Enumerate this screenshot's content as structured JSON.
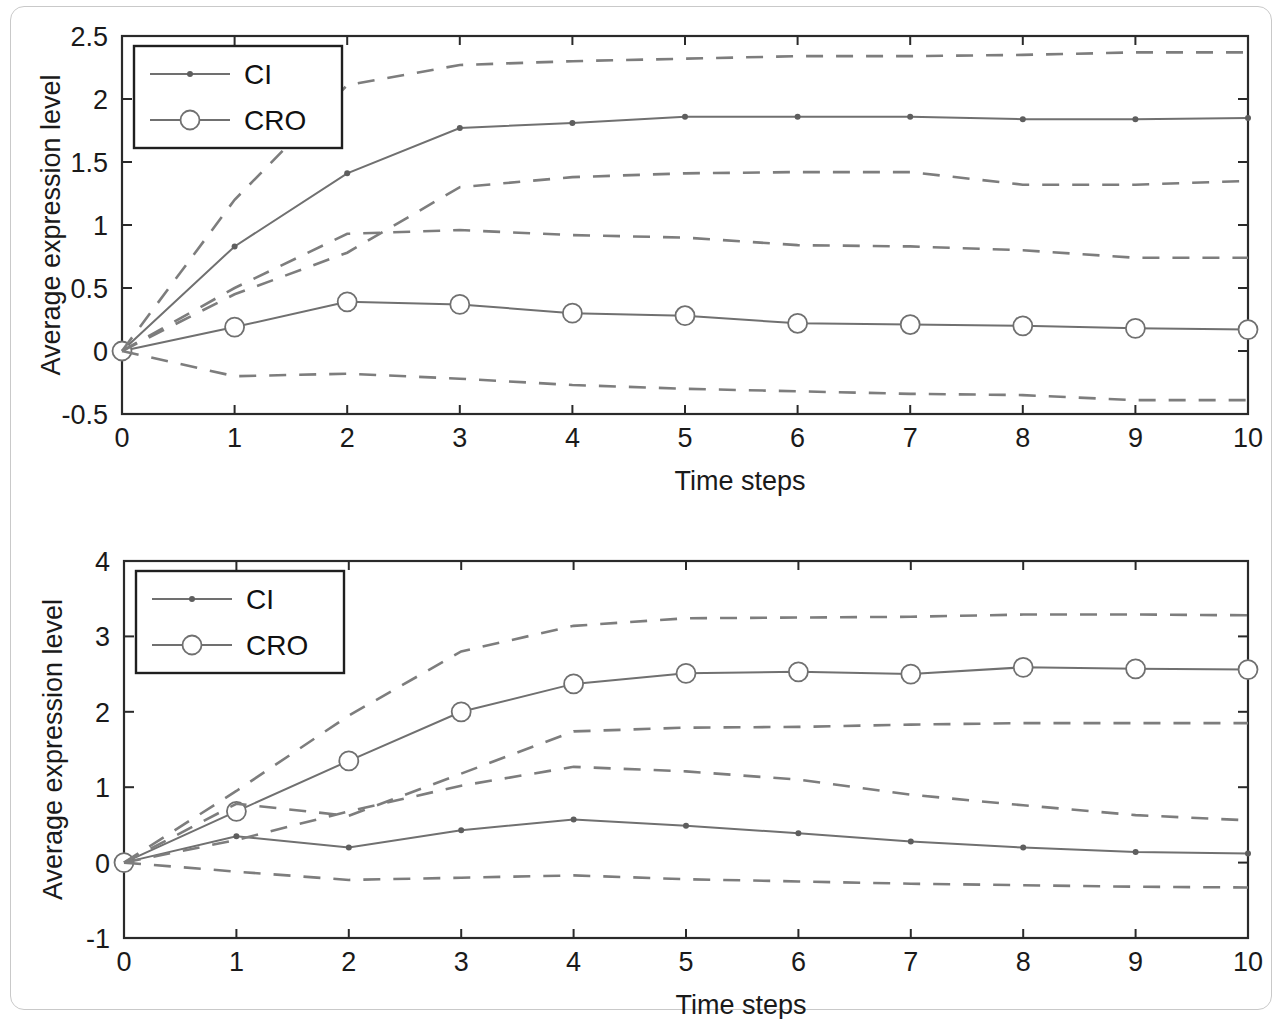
{
  "figure": {
    "panels": [
      {
        "id": "top-panel",
        "ylabel": "Average expression level",
        "xlabel": "Time steps",
        "legend": [
          {
            "label": "CI",
            "marker": "dot"
          },
          {
            "label": "CRO",
            "marker": "circle"
          }
        ],
        "y_ticks": [
          "-0.5",
          "0",
          "0.5",
          "1",
          "1.5",
          "2",
          "2.5"
        ],
        "x_ticks": [
          "0",
          "1",
          "2",
          "3",
          "4",
          "5",
          "6",
          "7",
          "8",
          "9",
          "10"
        ]
      },
      {
        "id": "bottom-panel",
        "ylabel": "Average expression level",
        "xlabel": "Time steps",
        "legend": [
          {
            "label": "CI",
            "marker": "dot"
          },
          {
            "label": "CRO",
            "marker": "circle"
          }
        ],
        "y_ticks": [
          "-1",
          "0",
          "1",
          "2",
          "3",
          "4"
        ],
        "x_ticks": [
          "0",
          "1",
          "2",
          "3",
          "4",
          "5",
          "6",
          "7",
          "8",
          "9",
          "10"
        ]
      }
    ],
    "colors": {
      "line": "#707070",
      "dashed": "#7d7d7d",
      "axis": "#2a2a2a",
      "text": "#141414",
      "frame": "#c9c9c9"
    }
  },
  "chart_data": [
    {
      "type": "line",
      "title": "",
      "xlabel": "Time steps",
      "ylabel": "Average expression level",
      "xlim": [
        0,
        10
      ],
      "ylim": [
        -0.5,
        2.5
      ],
      "yticks": [
        -0.5,
        0,
        0.5,
        1,
        1.5,
        2,
        2.5
      ],
      "xticks": [
        0,
        1,
        2,
        3,
        4,
        5,
        6,
        7,
        8,
        9,
        10
      ],
      "grid": false,
      "legend": [
        "CI",
        "CRO"
      ],
      "legend_position": "upper left",
      "x": [
        0,
        1,
        2,
        3,
        4,
        5,
        6,
        7,
        8,
        9,
        10
      ],
      "series": [
        {
          "name": "CI",
          "style": "solid",
          "marker": "dot",
          "values": [
            0.0,
            0.83,
            1.41,
            1.77,
            1.81,
            1.86,
            1.86,
            1.86,
            1.84,
            1.84,
            1.85
          ]
        },
        {
          "name": "CRO",
          "style": "solid",
          "marker": "circle",
          "values": [
            0.0,
            0.19,
            0.39,
            0.37,
            0.3,
            0.28,
            0.22,
            0.21,
            0.2,
            0.18,
            0.17
          ]
        },
        {
          "name": "CI upper band",
          "style": "dashed",
          "marker": "none",
          "values": [
            0.0,
            1.2,
            2.11,
            2.27,
            2.3,
            2.32,
            2.34,
            2.34,
            2.35,
            2.37,
            2.37
          ]
        },
        {
          "name": "CI lower band",
          "style": "dashed",
          "marker": "none",
          "values": [
            0.0,
            0.45,
            0.78,
            1.3,
            1.38,
            1.41,
            1.42,
            1.42,
            1.32,
            1.32,
            1.35
          ]
        },
        {
          "name": "CRO upper band",
          "style": "dashed",
          "marker": "none",
          "values": [
            0.0,
            0.5,
            0.93,
            0.96,
            0.92,
            0.9,
            0.84,
            0.83,
            0.8,
            0.74,
            0.74
          ]
        },
        {
          "name": "CRO lower band",
          "style": "dashed",
          "marker": "none",
          "values": [
            0.0,
            -0.2,
            -0.18,
            -0.22,
            -0.27,
            -0.3,
            -0.32,
            -0.34,
            -0.35,
            -0.39,
            -0.39
          ]
        }
      ]
    },
    {
      "type": "line",
      "title": "",
      "xlabel": "Time steps",
      "ylabel": "Average expression level",
      "xlim": [
        0,
        10
      ],
      "ylim": [
        -1,
        4
      ],
      "yticks": [
        -1,
        0,
        1,
        2,
        3,
        4
      ],
      "xticks": [
        0,
        1,
        2,
        3,
        4,
        5,
        6,
        7,
        8,
        9,
        10
      ],
      "grid": false,
      "legend": [
        "CI",
        "CRO"
      ],
      "legend_position": "upper left",
      "x": [
        0,
        1,
        2,
        3,
        4,
        5,
        6,
        7,
        8,
        9,
        10
      ],
      "series": [
        {
          "name": "CI",
          "style": "solid",
          "marker": "dot",
          "values": [
            0.0,
            0.35,
            0.2,
            0.43,
            0.57,
            0.49,
            0.39,
            0.28,
            0.2,
            0.14,
            0.12
          ]
        },
        {
          "name": "CRO",
          "style": "solid",
          "marker": "circle",
          "values": [
            0.0,
            0.68,
            1.35,
            2.0,
            2.37,
            2.51,
            2.53,
            2.5,
            2.59,
            2.57,
            2.56
          ]
        },
        {
          "name": "CRO upper band",
          "style": "dashed",
          "marker": "none",
          "values": [
            0.0,
            0.95,
            1.95,
            2.8,
            3.14,
            3.24,
            3.25,
            3.26,
            3.29,
            3.29,
            3.28
          ]
        },
        {
          "name": "CRO lower band",
          "style": "dashed",
          "marker": "none",
          "values": [
            0.0,
            0.78,
            0.62,
            1.18,
            1.74,
            1.79,
            1.8,
            1.83,
            1.85,
            1.85,
            1.85
          ]
        },
        {
          "name": "CI upper band",
          "style": "dashed",
          "marker": "none",
          "values": [
            0.0,
            0.3,
            0.68,
            1.02,
            1.27,
            1.21,
            1.1,
            0.9,
            0.76,
            0.63,
            0.56
          ]
        },
        {
          "name": "CI lower band",
          "style": "dashed",
          "marker": "none",
          "values": [
            0.0,
            -0.12,
            -0.23,
            -0.2,
            -0.17,
            -0.22,
            -0.25,
            -0.28,
            -0.3,
            -0.32,
            -0.33
          ]
        }
      ]
    }
  ]
}
